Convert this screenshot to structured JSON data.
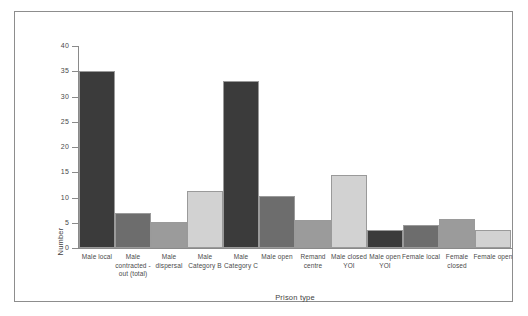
{
  "chart_data": {
    "type": "bar",
    "title": "",
    "xlabel": "Prison type",
    "ylabel": "Number",
    "ylim": [
      0,
      40
    ],
    "yticks": [
      0,
      5,
      10,
      15,
      20,
      25,
      30,
      35,
      40
    ],
    "ytick_labels": [
      "0",
      "5",
      "10",
      "15",
      "20",
      "25",
      "30",
      "35",
      "40"
    ],
    "grid": false,
    "legend": "none",
    "categories": [
      "Male local",
      "Male contracted -out (total)",
      "Male dispersal",
      "Male Category B",
      "Male Category C",
      "Male open",
      "Remand centre",
      "Male closed YOI",
      "Male open YOI",
      "Female local",
      "Female closed",
      "Female open"
    ],
    "values": [
      35,
      7,
      5.2,
      11.2,
      33,
      10.3,
      5.5,
      14.5,
      3.5,
      4.6,
      5.7,
      3.6
    ],
    "bar_colors": [
      "#3b3b3b",
      "#6d6d6d",
      "#9b9b9b",
      "#d2d2d2",
      "#3b3b3b",
      "#6d6d6d",
      "#9b9b9b",
      "#d2d2d2",
      "#3b3b3b",
      "#6d6d6d",
      "#9b9b9b",
      "#d2d2d2"
    ],
    "bar_edge_color": "#9a9a9a",
    "axis_color": "#8a8a8a",
    "frame_color": "#8d8d8d",
    "background": "#ffffff"
  }
}
